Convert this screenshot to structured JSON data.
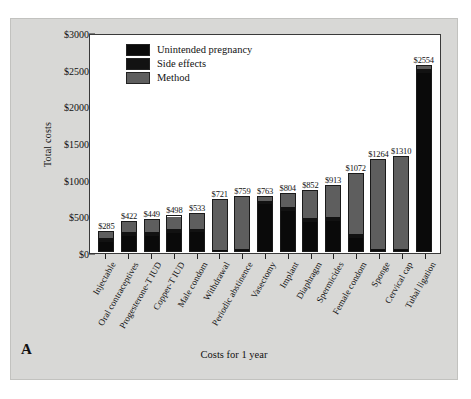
{
  "figure": {
    "panel_letter": "A",
    "background_color": "#d8d8d6"
  },
  "chart_data": {
    "type": "bar",
    "stacked": true,
    "title": "",
    "xlabel": "Costs for 1 year",
    "ylabel": "Total costs",
    "ylim": [
      0,
      3000
    ],
    "yticks": [
      "$0",
      "$500",
      "$1000",
      "$1500",
      "$2000",
      "$2500",
      "$3000"
    ],
    "ytick_values": [
      0,
      500,
      1000,
      1500,
      2000,
      2500,
      3000
    ],
    "grid": false,
    "legend_position": "top-left",
    "categories": [
      "Injectable",
      "Oral contraceptives",
      "Progesterone-T IUD",
      "Copper-T IUD",
      "Male condom",
      "Withdrawal",
      "Periodic abstinence",
      "Vasectomy",
      "Implant",
      "Diaphragm",
      "Spermicides",
      "Female condom",
      "Sponge",
      "Cervical cap",
      "Tubal ligation"
    ],
    "totals": [
      285,
      422,
      449,
      498,
      533,
      721,
      759,
      763,
      804,
      852,
      913,
      1072,
      1264,
      1310,
      2554
    ],
    "data_labels": [
      "$285",
      "$422",
      "$449",
      "$498",
      "$533",
      "$721",
      "$759",
      "$763",
      "$804",
      "$852",
      "$913",
      "$1072",
      "$1264",
      "$1310",
      "$2554"
    ],
    "series": [
      {
        "name": "Method",
        "color": "#5e5e5e",
        "values": [
          95,
          150,
          170,
          175,
          215,
          700,
          735,
          60,
          180,
          390,
          430,
          830,
          1230,
          1280,
          40
        ]
      },
      {
        "name": "Side effects",
        "color": "#121212",
        "values": [
          60,
          60,
          60,
          60,
          40,
          10,
          12,
          40,
          60,
          60,
          60,
          60,
          15,
          15,
          60
        ]
      },
      {
        "name": "Unintended pregnancy",
        "color": "#0a0a0a",
        "values": [
          130,
          212,
          219,
          263,
          278,
          11,
          12,
          663,
          564,
          402,
          423,
          182,
          19,
          15,
          2454
        ]
      }
    ],
    "legend": [
      {
        "label": "Unintended pregnancy",
        "color": "#0a0a0a"
      },
      {
        "label": "Side effects",
        "color": "#121212"
      },
      {
        "label": "Method",
        "color": "#5e5e5e"
      }
    ]
  }
}
